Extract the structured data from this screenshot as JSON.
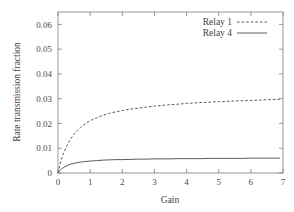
{
  "chart_data": {
    "type": "line",
    "title": "",
    "subtitle": "",
    "xlabel": "Gain",
    "ylabel": "Rate transmission fraction",
    "xlim": [
      0,
      7
    ],
    "ylim": [
      0,
      0.065
    ],
    "grid": false,
    "legend_position": "top-right-inside",
    "xticks": [
      "0",
      "1",
      "2",
      "3",
      "4",
      "5",
      "6",
      "7"
    ],
    "xtick_values": [
      0,
      1,
      2,
      3,
      4,
      5,
      6,
      7
    ],
    "yticks": [
      "0",
      "0.01",
      "0.02",
      "0.03",
      "0.04",
      "0.05",
      "0.06"
    ],
    "ytick_values": [
      0,
      0.01,
      0.02,
      0.03,
      0.04,
      0.05,
      0.06
    ],
    "x": [
      0.0,
      0.05,
      0.1,
      0.15,
      0.2,
      0.3,
      0.4,
      0.5,
      0.6,
      0.7,
      0.8,
      0.9,
      1.0,
      1.2,
      1.4,
      1.6,
      1.8,
      2.0,
      2.25,
      2.5,
      2.75,
      3.0,
      3.25,
      3.5,
      3.75,
      4.0,
      4.25,
      4.5,
      4.75,
      5.0,
      5.25,
      5.5,
      5.75,
      6.0,
      6.25,
      6.5,
      6.75,
      6.9
    ],
    "series": [
      {
        "name": "Relay 1",
        "style": "dashed",
        "color": "#5a5a5a",
        "values": [
          0.0,
          0.0028,
          0.0052,
          0.0072,
          0.0089,
          0.0117,
          0.0139,
          0.0157,
          0.0172,
          0.0184,
          0.0194,
          0.0203,
          0.0211,
          0.0223,
          0.0233,
          0.0241,
          0.0247,
          0.0252,
          0.0258,
          0.0262,
          0.0266,
          0.027,
          0.0273,
          0.0276,
          0.0278,
          0.0281,
          0.0283,
          0.0285,
          0.0286,
          0.0288,
          0.0289,
          0.0291,
          0.0292,
          0.0293,
          0.0294,
          0.0296,
          0.0297,
          0.0298
        ],
        "saturation_value": 0.03
      },
      {
        "name": "Relay 4",
        "style": "solid",
        "color": "#5a5a5a",
        "values": [
          0.0,
          0.0009,
          0.0015,
          0.002,
          0.0024,
          0.0031,
          0.0036,
          0.0039,
          0.0042,
          0.0044,
          0.0046,
          0.0047,
          0.0048,
          0.005,
          0.0052,
          0.0053,
          0.0054,
          0.0054,
          0.0055,
          0.0056,
          0.0056,
          0.0057,
          0.0057,
          0.0057,
          0.0058,
          0.0058,
          0.0058,
          0.0058,
          0.0059,
          0.0059,
          0.0059,
          0.0059,
          0.0059,
          0.006,
          0.006,
          0.006,
          0.006,
          0.006
        ],
        "saturation_value": 0.006
      }
    ],
    "legend": [
      {
        "label": "Relay 1",
        "style": "dashed"
      },
      {
        "label": "Relay 4",
        "style": "solid"
      }
    ]
  }
}
